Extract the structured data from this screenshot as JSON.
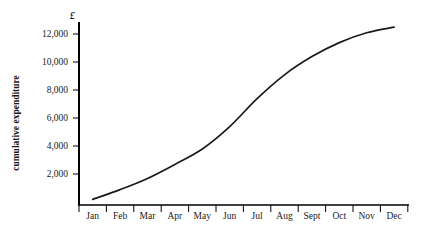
{
  "chart_data": {
    "type": "line",
    "title": "",
    "subtitle": "",
    "xlabel": "",
    "ylabel": "cumulative expenditure",
    "unit_symbol": "£",
    "categories": [
      "Jan",
      "Feb",
      "Mar",
      "Apr",
      "May",
      "Jun",
      "Jul",
      "Aug",
      "Sept",
      "Oct",
      "Nov",
      "Dec"
    ],
    "values": [
      400,
      1100,
      1900,
      2900,
      4000,
      5600,
      7600,
      9300,
      10600,
      11600,
      12300,
      12700
    ],
    "series": [
      {
        "name": "cumulative expenditure",
        "values": [
          400,
          1100,
          1900,
          2900,
          4000,
          5600,
          7600,
          9300,
          10600,
          11600,
          12300,
          12700
        ]
      }
    ],
    "y_ticks": [
      2000,
      4000,
      6000,
      8000,
      10000,
      12000
    ],
    "y_tick_labels": [
      "2,000",
      "4,000",
      "6,000",
      "8,000",
      "10,000",
      "12,000"
    ],
    "ylim": [
      0,
      13000
    ],
    "xlim": [
      0,
      12
    ],
    "grid": false,
    "legend": false,
    "legend_position": "none",
    "line_color": "#1a1a1a",
    "axis_color": "#000000",
    "background_color": "#ffffff",
    "annotations": []
  },
  "axes": {
    "y_axis_name": "y-axis",
    "x_axis_name": "x-axis"
  }
}
